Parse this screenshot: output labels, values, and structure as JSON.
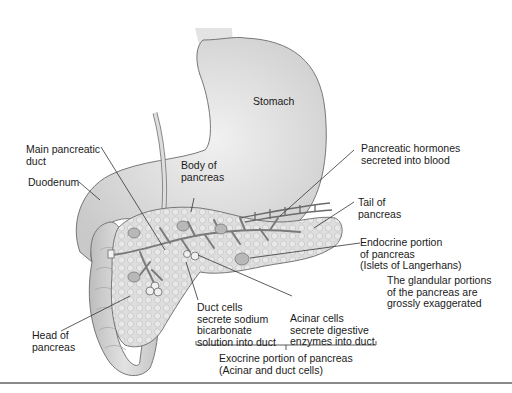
{
  "figure": {
    "colors": {
      "organ_fill": "#d6d6d6",
      "organ_light": "#e9e9e9",
      "outline": "#6a6a6a",
      "pancreas_fill": "#dcdcdc",
      "islet_fill": "#b5b5b5",
      "leader_line": "#333333",
      "text": "#1a1a1a",
      "rule": "#8a8a8a"
    }
  },
  "labels": {
    "stomach": "Stomach",
    "main_duct": "Main pancreatic\nduct",
    "duodenum": "Duodenum",
    "body": "Body of\npancreas",
    "hormones": "Pancreatic hormones\nsecreted into blood",
    "tail": "Tail of\npancreas",
    "endocrine": "Endocrine portion\nof pancreas\n(Islets of Langerhans)",
    "note": "The glandular portions\nof the pancreas are\ngrossly exaggerated",
    "duct_cells": "Duct cells\nsecrete sodium\nbicarbonate\nsolution into duct",
    "acinar_cells": "Acinar cells\nsecrete digestive\nenzymes into duct",
    "exocrine": "Exocrine portion of pancreas\n(Acinar and duct cells)",
    "head": "Head of\npancreas"
  }
}
